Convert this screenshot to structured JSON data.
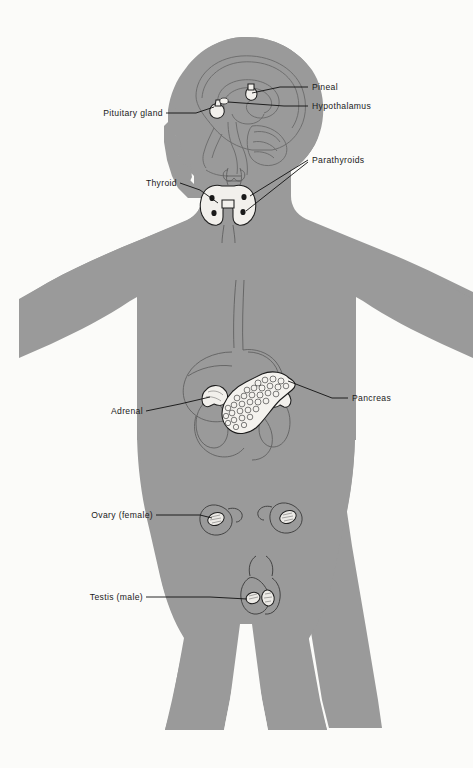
{
  "figure": {
    "background_color": "#fbfbf9",
    "body_color": "#9a9a9a",
    "line_color": "#1a1a1a"
  },
  "labels": [
    {
      "id": "pituitary",
      "text": "Pituitary gland",
      "align": "end",
      "text_x": 162,
      "text_y": 116,
      "leader": "M 166 113 L 196 113 L 214 107"
    },
    {
      "id": "pineal",
      "text": "Pineal",
      "align": "start",
      "text_x": 312,
      "text_y": 90,
      "leader": "M 308 87 L 280 87 L 251 94"
    },
    {
      "id": "hypothalamus",
      "text": "Hypothalamus",
      "align": "start",
      "text_x": 312,
      "text_y": 109,
      "leader": "M 308 106 L 284 106 L 222 102"
    },
    {
      "id": "thyroid",
      "text": "Thyroid",
      "align": "end",
      "text_x": 176,
      "text_y": 186,
      "leader": "M 180 183 L 200 190 L 219 203"
    },
    {
      "id": "parathyroids",
      "text": "Parathyroids",
      "align": "start",
      "text_x": 312,
      "text_y": 163,
      "leader": "M 308 160 L 252 196"
    },
    {
      "id": "parathyroids2",
      "text": "",
      "align": "start",
      "text_x": 312,
      "text_y": 163,
      "leader": "M 308 162 L 245 209"
    },
    {
      "id": "adrenal",
      "text": "Adrenal",
      "align": "end",
      "text_x": 142,
      "text_y": 414,
      "leader": "M 146 411 L 180 404 L 212 398"
    },
    {
      "id": "pancreas",
      "text": "Pancreas",
      "align": "start",
      "text_x": 352,
      "text_y": 401,
      "leader": "M 348 398 L 332 398 L 290 387"
    },
    {
      "id": "ovary",
      "text": "Ovary  (female)",
      "align": "end",
      "text_x": 152,
      "text_y": 518,
      "leader": "M 156 515 L 200 515 L 214 517"
    },
    {
      "id": "testis",
      "text": "Testis  (male)",
      "align": "end",
      "text_x": 142,
      "text_y": 600,
      "leader": "M 146 597 L 210 597 L 246 600"
    }
  ],
  "glands": [
    {
      "id": "pituitary-gland",
      "name": "pituitary"
    },
    {
      "id": "pineal-gland",
      "name": "pineal"
    },
    {
      "id": "hypothalamus-region",
      "name": "hypothalamus"
    },
    {
      "id": "thyroid-gland",
      "name": "thyroid"
    },
    {
      "id": "parathyroid-glands",
      "name": "parathyroids",
      "count": 4
    },
    {
      "id": "adrenal-glands",
      "name": "adrenal",
      "count": 2
    },
    {
      "id": "pancreas-gland",
      "name": "pancreas"
    },
    {
      "id": "ovaries",
      "name": "ovary",
      "count": 2
    },
    {
      "id": "testes",
      "name": "testis",
      "count": 2
    }
  ]
}
